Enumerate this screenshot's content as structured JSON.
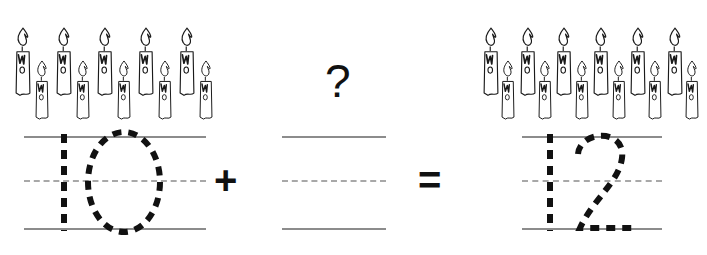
{
  "worksheet": {
    "type": "addition-tracing-worksheet",
    "equation_text": "10 + ? = 12",
    "question_symbol": "?",
    "plus_symbol": "+",
    "equals_symbol": "=",
    "ink_color": "#111111",
    "rule_solid_color": "#8c8c8c",
    "rule_dashed_color": "#a8a8a8",
    "candle_outline_color": "#1a1a1a"
  },
  "terms": [
    {
      "id": "addend-1",
      "label": "first-addend",
      "candle_count": 10,
      "tall_candles": 5,
      "short_candles": 5,
      "traced_numeral": "10",
      "numeral_style": "dashed-trace",
      "answer_blank": false
    },
    {
      "id": "addend-2",
      "label": "missing-addend",
      "candle_count": 0,
      "tall_candles": 0,
      "short_candles": 0,
      "traced_numeral": "",
      "numeral_style": "blank",
      "answer_blank": true
    },
    {
      "id": "sum",
      "label": "sum",
      "candle_count": 12,
      "tall_candles": 6,
      "short_candles": 6,
      "traced_numeral": "12",
      "numeral_style": "dashed-trace",
      "answer_blank": false
    }
  ],
  "chart_data": {
    "type": "bar",
    "title": "10 + ? = 12",
    "categories": [
      "10",
      "?",
      "12"
    ],
    "values": [
      10,
      0,
      12
    ],
    "xlabel": "",
    "ylabel": "candles",
    "ylim": [
      0,
      12
    ]
  }
}
